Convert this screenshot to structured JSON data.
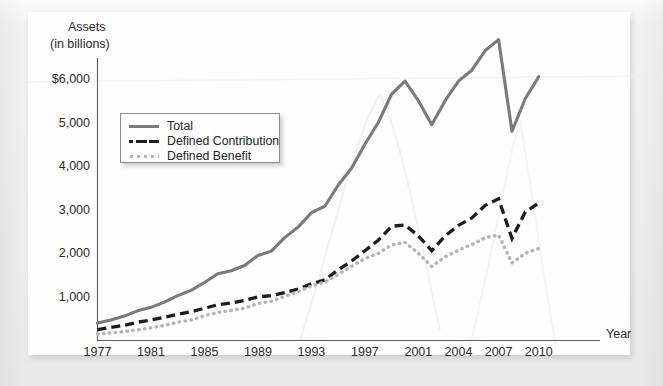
{
  "chart_data": {
    "type": "line",
    "title": "",
    "ylabel_line1": "Assets",
    "ylabel_line2": "(in billions)",
    "xlabel": "Year",
    "x": [
      1977,
      1978,
      1979,
      1980,
      1981,
      1982,
      1983,
      1984,
      1985,
      1986,
      1987,
      1988,
      1989,
      1990,
      1991,
      1992,
      1993,
      1994,
      1995,
      1996,
      1997,
      1998,
      1999,
      2000,
      2001,
      2002,
      2003,
      2004,
      2005,
      2006,
      2007,
      2008,
      2009,
      2010
    ],
    "xticks": [
      "1977",
      "1981",
      "1985",
      "1989",
      "1993",
      "1997",
      "2001",
      "2004",
      "2007",
      "2010"
    ],
    "xtick_values": [
      1977,
      1981,
      1985,
      1989,
      1993,
      1997,
      2001,
      2004,
      2007,
      2010
    ],
    "yticks": [
      "$6,000",
      "5,000",
      "4,000",
      "3,000",
      "2,000",
      "1,000"
    ],
    "ytick_values": [
      6000,
      5000,
      4000,
      3000,
      2000,
      1000
    ],
    "ylim": [
      0,
      6600
    ],
    "xlim": [
      1977,
      2011
    ],
    "grid": false,
    "legend_position": "upper-left",
    "series": [
      {
        "name": "Total",
        "style": "solid",
        "color": "#7a7a7a",
        "values": [
          400,
          470,
          560,
          680,
          760,
          880,
          1030,
          1150,
          1330,
          1530,
          1600,
          1720,
          1950,
          2050,
          2360,
          2600,
          2930,
          3080,
          3560,
          3950,
          4500,
          5000,
          5650,
          5950,
          5500,
          4950,
          5500,
          5950,
          6200,
          6650,
          6900,
          4800,
          5550,
          6050
        ]
      },
      {
        "name": "Defined Contribution",
        "style": "dashed",
        "color": "#1c1c1c",
        "values": [
          250,
          300,
          350,
          420,
          470,
          530,
          600,
          660,
          740,
          820,
          860,
          920,
          1000,
          1030,
          1100,
          1180,
          1300,
          1390,
          1620,
          1820,
          2060,
          2300,
          2620,
          2650,
          2400,
          2060,
          2400,
          2640,
          2810,
          3100,
          3250,
          2340,
          2950,
          3150
        ]
      },
      {
        "name": "Defined Benefit",
        "style": "dotted",
        "color": "#b4b4b4",
        "values": [
          150,
          175,
          205,
          245,
          290,
          345,
          420,
          470,
          570,
          640,
          690,
          740,
          850,
          900,
          1010,
          1120,
          1250,
          1340,
          1520,
          1700,
          1880,
          2000,
          2190,
          2250,
          2000,
          1700,
          1920,
          2070,
          2200,
          2360,
          2420,
          1780,
          2000,
          2110
        ]
      }
    ]
  },
  "legend": {
    "items": [
      {
        "label": "Total"
      },
      {
        "label": "Defined Contribution"
      },
      {
        "label": "Defined Benefit"
      }
    ]
  }
}
